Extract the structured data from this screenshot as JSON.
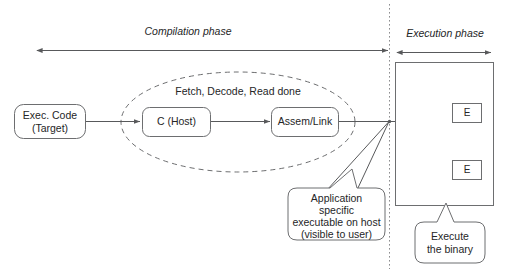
{
  "diagram": {
    "colors": {
      "background": "#ffffff",
      "stroke": "#58595b",
      "shape_stroke": "#6d6e70",
      "text": "#252627",
      "divider": "#8c8d8f"
    },
    "phases": {
      "compilation": {
        "label": "Compilation phase"
      },
      "execution": {
        "label": "Execution phase"
      }
    },
    "nodes": {
      "exec_code": {
        "line1": "Exec. Code",
        "line2": "(Target)"
      },
      "c_host": {
        "label": "C (Host)"
      },
      "assem_link": {
        "label": "Assem/Link"
      },
      "grouping": {
        "label": "Fetch, Decode, Read done"
      },
      "execution_unit_1": {
        "label": "E"
      },
      "execution_unit_2": {
        "label": "E"
      }
    },
    "callouts": {
      "application": {
        "line1": "Application",
        "line2": "specific",
        "line3": "executable on host",
        "line4": "(visible to user)"
      },
      "execute": {
        "line1": "Execute",
        "line2": "the binary"
      }
    }
  }
}
